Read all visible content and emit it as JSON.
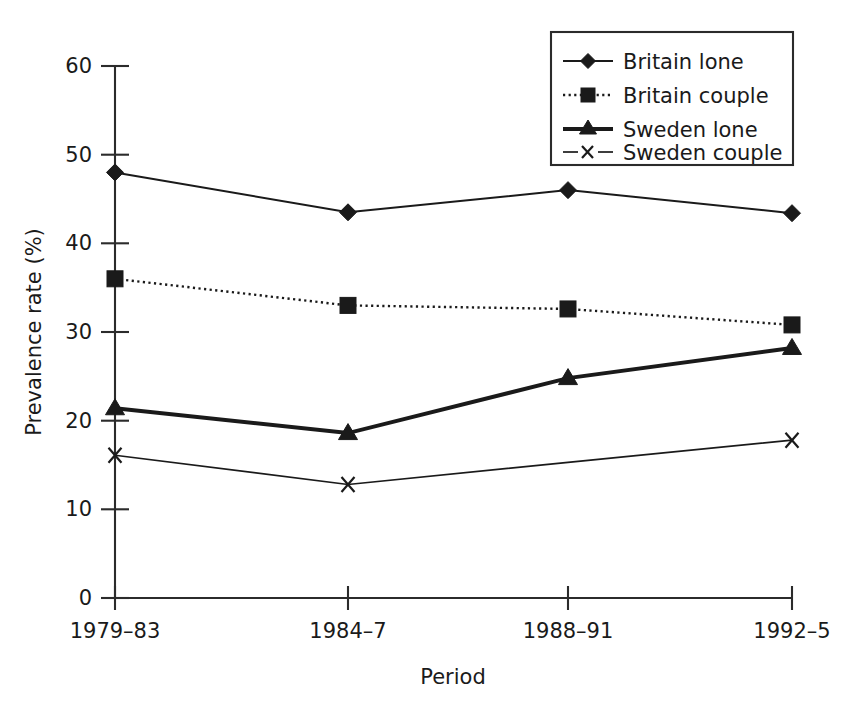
{
  "chart_data": {
    "type": "line",
    "title": "",
    "xlabel": "Period",
    "ylabel": "Prevalence rate (%)",
    "categories": [
      "1979–83",
      "1984–7",
      "1988–91",
      "1992–5"
    ],
    "ylim": [
      0,
      60
    ],
    "yticks": [
      0,
      10,
      20,
      30,
      40,
      50,
      60
    ],
    "ytick_labels": [
      "0",
      "10",
      "20",
      "30",
      "40",
      "50",
      "60"
    ],
    "grid": false,
    "legend_position": "top-right",
    "series": [
      {
        "name": "Britain lone",
        "values": [
          48.0,
          43.5,
          46.0,
          43.4
        ],
        "marker": "diamond",
        "line_style": "solid",
        "line_width": "thin",
        "color": "#1a1a1a"
      },
      {
        "name": "Britain couple",
        "values": [
          36.0,
          33.0,
          32.6,
          30.8
        ],
        "marker": "square",
        "line_style": "dotted",
        "line_width": "thin",
        "color": "#1a1a1a"
      },
      {
        "name": "Sweden lone",
        "values": [
          21.4,
          18.6,
          24.8,
          28.2
        ],
        "marker": "triangle",
        "line_style": "solid",
        "line_width": "thick",
        "color": "#1a1a1a"
      },
      {
        "name": "Sweden couple",
        "values": [
          16.1,
          12.8,
          15.3,
          17.8
        ],
        "marker": "x",
        "line_style": "solid",
        "line_width": "thin",
        "color": "#1a1a1a",
        "marker_visible": [
          true,
          true,
          false,
          true
        ]
      }
    ]
  },
  "legend": {
    "items": [
      {
        "label": "Britain lone"
      },
      {
        "label": "Britain couple"
      },
      {
        "label": "Sweden lone"
      },
      {
        "label": "Sweden couple"
      }
    ]
  },
  "axes": {
    "x_title": "Period",
    "y_title": "Prevalence rate (%)",
    "x_tick_labels": [
      "1979–83",
      "1984–7",
      "1988–91",
      "1992–5"
    ],
    "y_tick_labels": [
      "0",
      "10",
      "20",
      "30",
      "40",
      "50",
      "60"
    ]
  }
}
